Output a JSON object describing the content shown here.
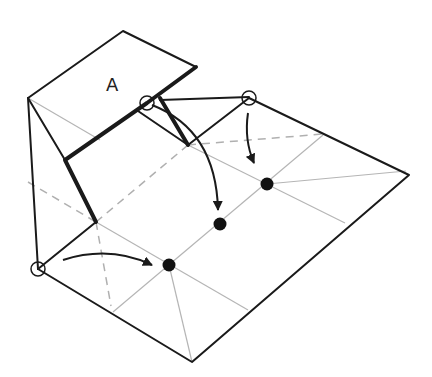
{
  "figure": {
    "type": "origami-fold-diagram",
    "flap_label": "A",
    "colors": {
      "line": "#1a1a1a",
      "crease": "#b5b5b5",
      "dashed": "#b0b0b0",
      "background": "#ffffff"
    },
    "markers": {
      "target_points": [
        "target-point-1",
        "target-point-2",
        "target-point-3"
      ],
      "source_points": [
        "source-point-left",
        "source-point-top-middle",
        "source-point-top-right"
      ]
    },
    "arrows": [
      {
        "from": "source-point-left",
        "to": "target-point-1"
      },
      {
        "from": "source-point-top-middle",
        "to": "target-point-2"
      },
      {
        "from": "source-point-top-right",
        "to": "target-point-3"
      }
    ]
  }
}
